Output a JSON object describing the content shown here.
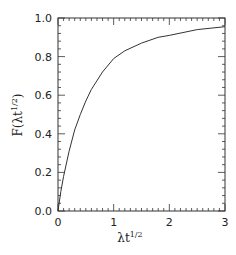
{
  "chart_data": {
    "type": "line",
    "title": "",
    "xlabel": "λt^(1/2)",
    "ylabel": "F(λt^(1/2))",
    "xlim": [
      0,
      3
    ],
    "ylim": [
      0,
      1
    ],
    "x_ticks": [
      "0",
      "1",
      "2",
      "3"
    ],
    "y_ticks": [
      "0.0",
      "0.2",
      "0.4",
      "0.6",
      "0.8",
      "1.0"
    ],
    "grid": false,
    "legend": null,
    "series": [
      {
        "name": "F",
        "color": "#333333",
        "x": [
          0,
          0.05,
          0.1,
          0.2,
          0.3,
          0.4,
          0.5,
          0.6,
          0.8,
          1.0,
          1.2,
          1.5,
          1.8,
          2.0,
          2.5,
          3.0
        ],
        "y": [
          0,
          0.1,
          0.18,
          0.31,
          0.42,
          0.5,
          0.57,
          0.63,
          0.72,
          0.79,
          0.83,
          0.87,
          0.9,
          0.91,
          0.94,
          0.955
        ]
      }
    ]
  },
  "labels": {
    "xlabel_main": "λt",
    "xlabel_sup": "1/2",
    "ylabel_main_prefix": "F(λt",
    "ylabel_sup": "1/2",
    "ylabel_suffix": ")"
  }
}
